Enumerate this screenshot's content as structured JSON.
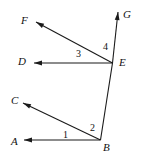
{
  "figure": {
    "background_color": "#ffffff",
    "line_color": "#1a1a1a",
    "text_color": "#111111",
    "width": 141,
    "height": 159,
    "point_labels": [
      {
        "name": "F",
        "text": "F",
        "x": 21,
        "y": 15
      },
      {
        "name": "G",
        "text": "G",
        "x": 123,
        "y": 9
      },
      {
        "name": "D",
        "text": "D",
        "x": 18,
        "y": 56
      },
      {
        "name": "E",
        "text": "E",
        "x": 119,
        "y": 57
      },
      {
        "name": "C",
        "text": "C",
        "x": 11,
        "y": 95
      },
      {
        "name": "A",
        "text": "A",
        "x": 11,
        "y": 136
      },
      {
        "name": "B",
        "text": "B",
        "x": 103,
        "y": 142
      }
    ],
    "angle_labels": [
      {
        "name": "1",
        "text": "1",
        "x": 63,
        "y": 130
      },
      {
        "name": "2",
        "text": "2",
        "x": 90,
        "y": 123
      },
      {
        "name": "3",
        "text": "3",
        "x": 76,
        "y": 49
      },
      {
        "name": "4",
        "text": "4",
        "x": 103,
        "y": 42
      }
    ],
    "vertices": {
      "B": {
        "x": 100.5,
        "y": 140.0
      },
      "E": {
        "x": 112.5,
        "y": 63.0
      }
    },
    "rays": [
      {
        "name": "ray-b-to-a",
        "from": "B",
        "tip_x": 24.0,
        "tip_y": 140.0,
        "arrow": true
      },
      {
        "name": "ray-b-to-c",
        "from": "B",
        "tip_x": 23.0,
        "tip_y": 103.0,
        "arrow": true
      },
      {
        "name": "ray-e-to-d",
        "from": "E",
        "tip_x": 34.0,
        "tip_y": 63.0,
        "arrow": true
      },
      {
        "name": "ray-e-to-f",
        "from": "E",
        "tip_x": 36.0,
        "tip_y": 22.0,
        "arrow": true
      },
      {
        "name": "ray-e-to-g",
        "from": "E",
        "tip_x": 118.0,
        "tip_y": 12.0,
        "arrow": true
      }
    ],
    "segments": [
      {
        "name": "segment-b-e",
        "x1": 100.5,
        "y1": 140.0,
        "x2": 112.5,
        "y2": 63.0
      }
    ]
  }
}
